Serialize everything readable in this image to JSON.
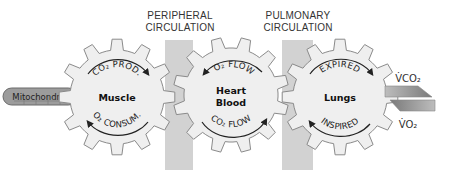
{
  "headers": {
    "peripheral": {
      "line1": "PERIPHERAL",
      "line2": "CIRCULATION"
    },
    "pulmonary": {
      "line1": "PULMONARY",
      "line2": "CIRCULATION"
    }
  },
  "mitochondria": {
    "label": "Mitochondria"
  },
  "gears": [
    {
      "id": "muscle",
      "center_label": [
        "Muscle"
      ],
      "top_arc": "CO₂ PROD.",
      "bottom_arc": "O₂ CONSUM.",
      "top_arrow": "clockwise-right",
      "bottom_arrow": "left"
    },
    {
      "id": "heart-blood",
      "center_label": [
        "Heart",
        "Blood"
      ],
      "top_arc": "O₂ FLOW",
      "bottom_arc": "CO₂ FLOW",
      "top_arrow": "left",
      "bottom_arrow": "right"
    },
    {
      "id": "lungs",
      "center_label": [
        "Lungs"
      ],
      "top_arc": "EXPIRED",
      "bottom_arc": "INSPIRED",
      "top_arrow": "right",
      "bottom_arrow": "left"
    }
  ],
  "flux": {
    "vco2": "V̇CO₂",
    "vo2": "V̇O₂"
  },
  "colors": {
    "gear_fill": "#efefef",
    "gear_stroke": "#8a8a8a",
    "band": "#cfcfcf",
    "mito_fill": "#9a9a9a",
    "arrow": "#222222"
  }
}
